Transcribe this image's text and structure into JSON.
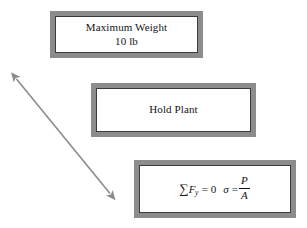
{
  "figure": {
    "clipped_header_text": "— ——— ——",
    "boxes": [
      {
        "id": "max-weight",
        "line1": "Maximum Weight",
        "line2": "10 lb"
      },
      {
        "id": "hold-plant",
        "line1": "Hold Plant"
      },
      {
        "id": "equations",
        "equation1": {
          "sum_symbol": "∑",
          "variable": "F",
          "subscript": "y",
          "relation": "= 0"
        },
        "equation2": {
          "variable": "σ",
          "relation": "=",
          "numerator": "P",
          "denominator": "A"
        }
      }
    ],
    "arrow": {
      "name": "double-headed-arrow",
      "start_label": "upper-left-arrowhead",
      "end_label": "lower-right-arrowhead"
    },
    "colors": {
      "box_border": "#8c8c8c",
      "box_inner_rule": "#3a3a3a",
      "box_fill": "#ffffff",
      "text": "#141414",
      "arrow": "#8c8c8c",
      "page_background": "#ffffff"
    }
  }
}
